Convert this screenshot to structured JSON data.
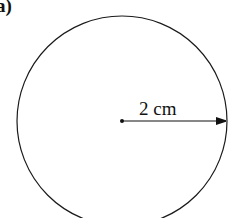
{
  "figure": {
    "label": "a)",
    "shape": "circle",
    "radius_label": "2 cm",
    "stroke_color": "#1a1a1a",
    "background": "#ffffff"
  }
}
